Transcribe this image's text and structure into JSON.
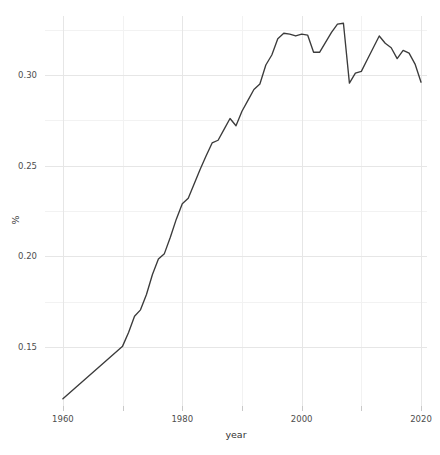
{
  "chart_data": {
    "type": "line",
    "title": "",
    "subtitle": "",
    "xlabel": "year",
    "ylabel": "%",
    "xlim": [
      1957,
      2021
    ],
    "ylim": [
      0.1175,
      0.3325
    ],
    "grid": true,
    "legend": null,
    "x_ticks": [
      1960,
      1980,
      2000,
      2020
    ],
    "x_tick_labels": [
      "1960",
      "1980",
      "2000",
      "2020"
    ],
    "x_minor_ticks": [
      1970,
      1990,
      2010
    ],
    "y_ticks": [
      0.15,
      0.2,
      0.25,
      0.3
    ],
    "y_tick_labels": [
      "0.15",
      "0.20",
      "0.25",
      "0.30"
    ],
    "y_minor_ticks": [
      0.175,
      0.225,
      0.275,
      0.325
    ],
    "line_color": "#3b3b3b",
    "panel_background": "#ffffff",
    "gridline_color": "#e6e6e6",
    "minor_gridline_color": "#f2f2f2",
    "series": [
      {
        "name": "%",
        "x": [
          1960,
          1961,
          1962,
          1963,
          1964,
          1965,
          1966,
          1967,
          1968,
          1969,
          1970,
          1971,
          1972,
          1973,
          1974,
          1975,
          1976,
          1977,
          1978,
          1979,
          1980,
          1981,
          1982,
          1983,
          1984,
          1985,
          1986,
          1987,
          1988,
          1989,
          1990,
          1991,
          1992,
          1993,
          1994,
          1995,
          1996,
          1997,
          1998,
          1999,
          2000,
          2001,
          2002,
          2003,
          2004,
          2005,
          2006,
          2007,
          2008,
          2009,
          2010,
          2011,
          2012,
          2013,
          2014,
          2015,
          2016,
          2017,
          2018,
          2019,
          2020
        ],
        "y": [
          0.1215,
          0.1244,
          0.1273,
          0.1302,
          0.1331,
          0.136,
          0.1389,
          0.1418,
          0.1447,
          0.1476,
          0.1505,
          0.158,
          0.167,
          0.1705,
          0.179,
          0.19,
          0.1985,
          0.2015,
          0.2105,
          0.2205,
          0.229,
          0.232,
          0.24,
          0.248,
          0.2555,
          0.2625,
          0.264,
          0.27,
          0.276,
          0.272,
          0.28,
          0.286,
          0.292,
          0.295,
          0.3055,
          0.311,
          0.32,
          0.323,
          0.3225,
          0.3215,
          0.3225,
          0.322,
          0.3125,
          0.3125,
          0.318,
          0.3235,
          0.328,
          0.3285,
          0.2955,
          0.301,
          0.302,
          0.3085,
          0.315,
          0.3215,
          0.3175,
          0.315,
          0.309,
          0.3135,
          0.312,
          0.306,
          0.296
        ]
      }
    ]
  }
}
